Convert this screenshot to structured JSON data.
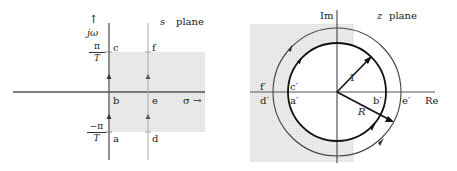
{
  "s_plane": {
    "title_var": "s",
    "title_word": "plane",
    "vertical_axis_arrow": "↑",
    "vertical_axis_label": "jω",
    "horizontal_axis_label": "σ →",
    "upper_tick": {
      "num": "π",
      "den": "T"
    },
    "lower_tick": {
      "num": "−π",
      "den": "T"
    },
    "points": {
      "a": "a",
      "b": "b",
      "c": "c",
      "d": "d",
      "e": "e",
      "f": "f"
    },
    "region_color": "#e6e6e6",
    "axis_color": "#555555"
  },
  "z_plane": {
    "title_var": "z",
    "title_word": "plane",
    "im_label": "Im",
    "re_label": "Re",
    "inner_radius_label": "1",
    "outer_radius_label": "R",
    "points": {
      "a": "a′",
      "b": "b′",
      "c": "c′",
      "d": "d′",
      "e": "e′",
      "f": "f′"
    },
    "region_color": "#e6e6e6",
    "circle_color": "#222222"
  }
}
